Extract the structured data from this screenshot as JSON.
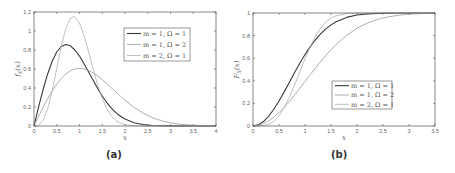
{
  "chart_data": [
    {
      "id": "a",
      "type": "line",
      "caption": "(a)",
      "title": "",
      "xlabel": "x",
      "ylabel": "f_X(x)",
      "xlim": [
        0,
        4
      ],
      "ylim": [
        0,
        1.2
      ],
      "xticks": [
        0,
        0.5,
        1,
        1.5,
        2,
        2.5,
        3,
        3.5,
        4
      ],
      "xtick_labels": [
        "0",
        "0.5",
        "1",
        "1.5",
        "2",
        "2.5",
        "3",
        "3.5",
        "4"
      ],
      "yticks": [
        0,
        0.2,
        0.4,
        0.6,
        0.8,
        1,
        1.2
      ],
      "ytick_labels": [
        "0",
        "0.2",
        "0.4",
        "0.6",
        "0.8",
        "1",
        "1.2"
      ],
      "grid": false,
      "legend_position": "upper right",
      "frame": {
        "left": 34,
        "top": 12,
        "right": 216,
        "bottom": 126
      },
      "legend_box": {
        "x": 124,
        "y": 28,
        "w": 66,
        "h": 33
      },
      "series": [
        {
          "name": "m = 1, Ω = 1",
          "color": "#3a3a3a",
          "width": 1.1,
          "x": [
            0,
            0.1,
            0.2,
            0.3,
            0.4,
            0.5,
            0.6,
            0.7,
            0.8,
            0.9,
            1.0,
            1.1,
            1.2,
            1.3,
            1.4,
            1.5,
            1.6,
            1.7,
            1.8,
            1.9,
            2.0,
            2.2,
            2.4,
            2.6,
            2.8,
            3.0,
            3.5,
            4.0
          ],
          "y": [
            0,
            0.198,
            0.384,
            0.548,
            0.682,
            0.779,
            0.837,
            0.858,
            0.844,
            0.8,
            0.736,
            0.656,
            0.569,
            0.481,
            0.395,
            0.316,
            0.247,
            0.189,
            0.141,
            0.103,
            0.073,
            0.035,
            0.015,
            0.006,
            0.002,
            0.001,
            0,
            0
          ]
        },
        {
          "name": "m = 1, Ω = 2",
          "color": "#9a9a9a",
          "width": 0.8,
          "x": [
            0,
            0.1,
            0.2,
            0.3,
            0.4,
            0.5,
            0.6,
            0.7,
            0.8,
            0.9,
            1.0,
            1.1,
            1.2,
            1.3,
            1.4,
            1.5,
            1.6,
            1.7,
            1.8,
            1.9,
            2.0,
            2.2,
            2.4,
            2.6,
            2.8,
            3.0,
            3.2,
            3.5,
            4.0
          ],
          "y": [
            0,
            0.1,
            0.196,
            0.287,
            0.369,
            0.441,
            0.501,
            0.548,
            0.581,
            0.6,
            0.607,
            0.602,
            0.584,
            0.56,
            0.525,
            0.487,
            0.446,
            0.401,
            0.358,
            0.313,
            0.271,
            0.196,
            0.135,
            0.088,
            0.056,
            0.033,
            0.019,
            0.008,
            0.001
          ]
        },
        {
          "name": "m = 2, Ω = 1",
          "color": "#b0b0b0",
          "width": 0.8,
          "x": [
            0,
            0.1,
            0.2,
            0.3,
            0.4,
            0.5,
            0.6,
            0.7,
            0.8,
            0.866,
            0.9,
            1.0,
            1.1,
            1.2,
            1.3,
            1.4,
            1.5,
            1.6,
            1.7,
            1.8,
            1.9,
            2.0,
            2.2,
            2.5,
            3.0,
            4.0
          ],
          "y": [
            0,
            0.008,
            0.059,
            0.181,
            0.372,
            0.607,
            0.843,
            1.029,
            1.134,
            1.15,
            1.146,
            1.083,
            0.952,
            0.781,
            0.601,
            0.432,
            0.292,
            0.183,
            0.107,
            0.058,
            0.03,
            0.013,
            0.002,
            0,
            0,
            0
          ]
        }
      ]
    },
    {
      "id": "b",
      "type": "line",
      "caption": "(b)",
      "title": "",
      "xlabel": "x",
      "ylabel": "F_X(x)",
      "xlim": [
        0,
        3.5
      ],
      "ylim": [
        0,
        1
      ],
      "xticks": [
        0,
        0.5,
        1,
        1.5,
        2,
        2.5,
        3,
        3.5
      ],
      "xtick_labels": [
        "0",
        "0.5",
        "1",
        "1.5",
        "2",
        "2.5",
        "3",
        "3.5"
      ],
      "yticks": [
        0,
        0.2,
        0.4,
        0.6,
        0.8,
        1
      ],
      "ytick_labels": [
        "0",
        "0.2",
        "0.4",
        "0.6",
        "0.8",
        "1"
      ],
      "grid": false,
      "legend_position": "lower right",
      "frame": {
        "left": 253,
        "top": 13,
        "right": 435,
        "bottom": 126
      },
      "legend_box": {
        "x": 332,
        "y": 81,
        "w": 60,
        "h": 28
      },
      "series": [
        {
          "name": "m = 1, Ω = 1",
          "color": "#3a3a3a",
          "width": 1.1,
          "x": [
            0,
            0.1,
            0.2,
            0.3,
            0.4,
            0.5,
            0.6,
            0.7,
            0.8,
            0.9,
            1.0,
            1.1,
            1.2,
            1.3,
            1.4,
            1.5,
            1.6,
            1.8,
            2.0,
            2.2,
            2.5,
            3.0,
            3.5
          ],
          "y": [
            0,
            0.01,
            0.039,
            0.086,
            0.148,
            0.221,
            0.302,
            0.387,
            0.473,
            0.555,
            0.632,
            0.702,
            0.763,
            0.815,
            0.859,
            0.895,
            0.923,
            0.961,
            0.982,
            0.992,
            0.998,
            1.0,
            1.0
          ]
        },
        {
          "name": "m = 1, Ω = 2",
          "color": "#9a9a9a",
          "width": 0.8,
          "x": [
            0,
            0.1,
            0.2,
            0.3,
            0.4,
            0.5,
            0.6,
            0.7,
            0.8,
            0.9,
            1.0,
            1.2,
            1.4,
            1.6,
            1.8,
            2.0,
            2.2,
            2.4,
            2.6,
            2.8,
            3.0,
            3.2,
            3.5
          ],
          "y": [
            0,
            0.005,
            0.02,
            0.044,
            0.077,
            0.118,
            0.165,
            0.217,
            0.274,
            0.333,
            0.393,
            0.513,
            0.625,
            0.722,
            0.802,
            0.865,
            0.911,
            0.944,
            0.966,
            0.98,
            0.989,
            0.994,
            0.998
          ]
        },
        {
          "name": "m = 2, Ω = 1",
          "color": "#b0b0b0",
          "width": 0.8,
          "x": [
            0,
            0.1,
            0.2,
            0.3,
            0.4,
            0.5,
            0.6,
            0.7,
            0.8,
            0.9,
            1.0,
            1.1,
            1.2,
            1.3,
            1.4,
            1.5,
            1.6,
            1.8,
            2.0,
            2.5,
            3.0,
            3.5
          ],
          "y": [
            0,
            0.0002,
            0.003,
            0.014,
            0.041,
            0.09,
            0.163,
            0.255,
            0.363,
            0.477,
            0.594,
            0.701,
            0.794,
            0.866,
            0.919,
            0.954,
            0.976,
            0.995,
            0.999,
            1.0,
            1.0,
            1.0
          ]
        }
      ]
    }
  ],
  "captions": {
    "a": "(a)",
    "b": "(b)"
  }
}
